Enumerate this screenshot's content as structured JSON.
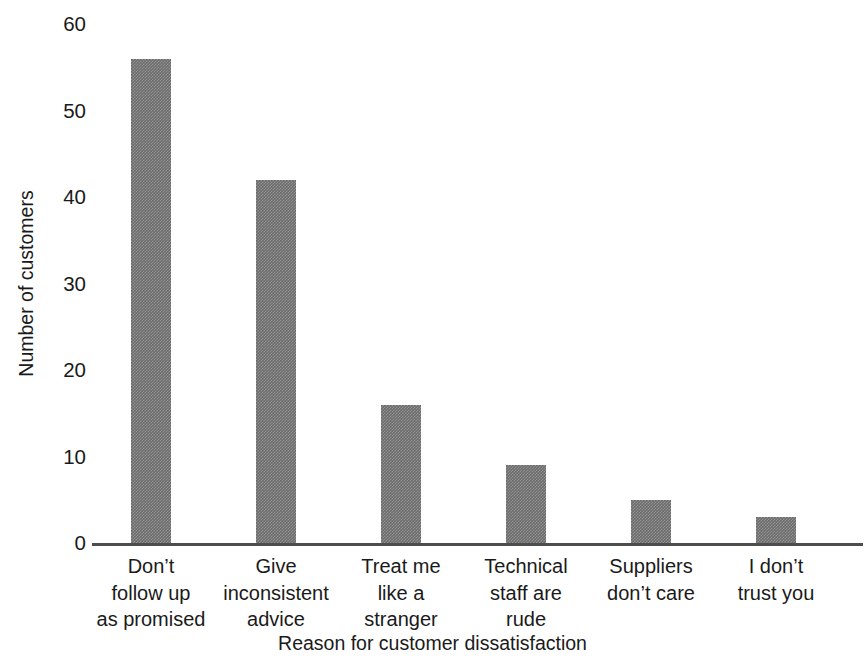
{
  "chart_data": {
    "type": "bar",
    "title": "",
    "xlabel": "Reason for customer dissatisfaction",
    "ylabel": "Number of customers",
    "categories": [
      "Don’t follow up as promised",
      "Give inconsistent advice",
      "Treat me like a stranger",
      "Technical staff are rude",
      "Suppliers don’t care",
      "I don’t trust you"
    ],
    "category_lines": [
      [
        "Don’t",
        "follow up",
        "as promised"
      ],
      [
        "Give",
        "inconsistent",
        "advice"
      ],
      [
        "Treat me",
        "like a",
        "stranger"
      ],
      [
        "Technical",
        "staff are",
        "rude"
      ],
      [
        "Suppliers",
        "don’t care"
      ],
      [
        "I don’t",
        "trust you"
      ]
    ],
    "values": [
      56,
      42,
      16,
      9,
      5,
      3
    ],
    "ylim": [
      0,
      60
    ],
    "yticks": [
      0,
      10,
      20,
      30,
      40,
      50,
      60
    ],
    "ytick_labels": [
      "0",
      "10",
      "20",
      "30",
      "40",
      "50",
      "60"
    ],
    "grid": false,
    "legend": "none",
    "bar_color": "#6d6d6d",
    "axis_color": "#4d4d4d"
  },
  "axes": {
    "y_title": "Number of customers",
    "x_title": "Reason for customer dissatisfaction"
  },
  "header": {
    "clipped_title": ""
  }
}
